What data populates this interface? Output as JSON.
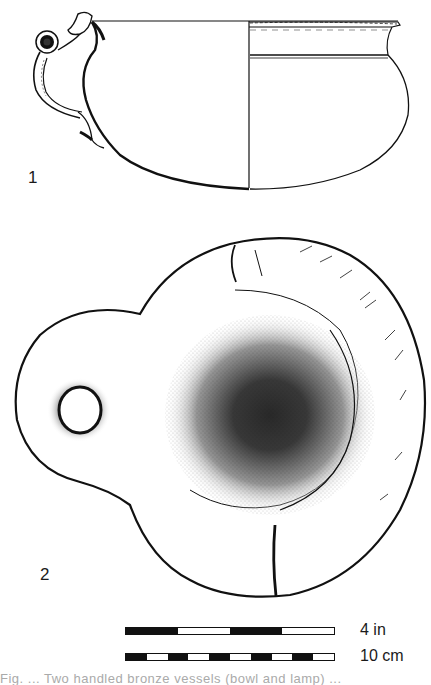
{
  "figures": [
    {
      "id": 1,
      "label": "1",
      "description": "Profile and section drawing of a bowl with ring handle"
    },
    {
      "id": 2,
      "label": "2",
      "description": "Stippled top view of a lamp with pierced handle"
    }
  ],
  "scale": {
    "imperial": {
      "label": "4 in",
      "segments": [
        "b",
        "w",
        "b",
        "w"
      ]
    },
    "metric": {
      "label": "10 cm",
      "segments": [
        "b",
        "w",
        "b",
        "w",
        "b",
        "w",
        "b",
        "w",
        "b",
        "w"
      ]
    }
  },
  "caption": {
    "text": "Fig. ... Two handled bronze vessels (bowl and lamp) ..."
  },
  "colors": {
    "ink": "#111111",
    "paper": "#ffffff"
  }
}
